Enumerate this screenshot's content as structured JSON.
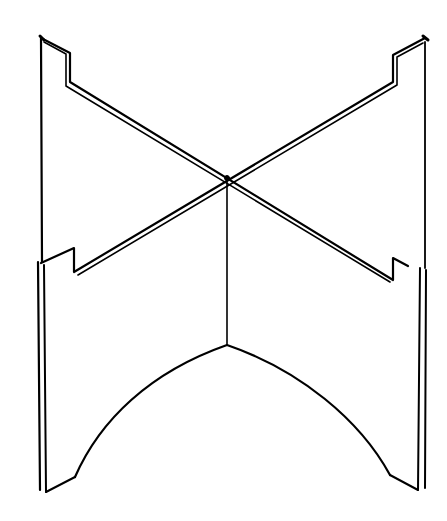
{
  "diagram": {
    "title": "Interlocking cross-slot stand (line drawing)",
    "stroke_color": "#000000",
    "background_color": "#ffffff",
    "parts": [
      {
        "name": "upper-left-panel",
        "description": "Vertical panel with stepped top-left notch and diagonal slotted edge"
      },
      {
        "name": "upper-right-panel",
        "description": "Vertical panel with stepped top-right notch and diagonal slotted edge"
      },
      {
        "name": "lower-left-panel",
        "description": "Lower panel with arched cutout and leg"
      },
      {
        "name": "lower-right-panel",
        "description": "Lower panel with arched cutout and leg"
      },
      {
        "name": "center-spine",
        "description": "Vertical center line where panels intersect"
      }
    ]
  }
}
